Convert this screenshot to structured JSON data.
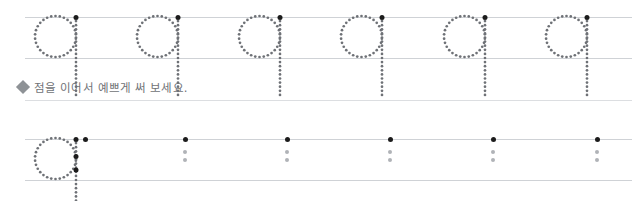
{
  "worksheet": {
    "letter": "q",
    "letter_name": "dotted-letter-q",
    "rows": [
      {
        "id": "model-row",
        "label": "Dotted model letters to trace",
        "top_rule_y": 17,
        "baseline_rule_y": 58,
        "glyph_count": 6,
        "glyph_x": [
          55,
          157,
          259,
          361,
          464,
          566
        ],
        "show_start_dot": true,
        "show_guide_dots": false
      },
      {
        "id": "practice-row",
        "label": "Practice row with starting dots",
        "top_rule_y": 139,
        "baseline_rule_y": 180,
        "glyph_count": 1,
        "glyph_x": [
          55
        ],
        "show_start_dot": true,
        "show_guide_dots": true
      }
    ],
    "practice_markers": {
      "x": [
        85,
        185,
        287,
        390,
        493,
        597
      ],
      "start_dot_y": 139,
      "guide_dot_y": [
        152,
        160
      ]
    },
    "rule_extent": {
      "left": 25,
      "right": 632
    }
  },
  "instruction": {
    "bullet_icon": "diamond-bullet-icon",
    "text": "점을 이어서 예쁘게 써 보세요.",
    "separator_y": 100
  },
  "colors": {
    "rule": "#b9bcc0",
    "rule_faint": "#cfd2d6",
    "separator": "#dcdee1",
    "dot_dark": "#1c1c1c",
    "dot_gray": "#b0b3b7",
    "glyph_dot": "#6e7176",
    "instruction_text": "#6f7276",
    "bullet": "#8e9296",
    "page_background": "#ffffff"
  }
}
